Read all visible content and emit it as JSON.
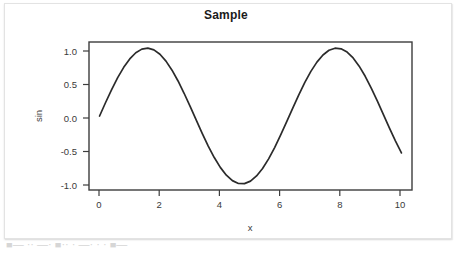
{
  "chart_data": {
    "type": "line",
    "title": "Sample",
    "xlabel": "x",
    "ylabel": "sin",
    "xlim": [
      -0.35,
      10.35
    ],
    "ylim": [
      -1.09,
      1.09
    ],
    "xticks": [
      "0",
      "2",
      "4",
      "6",
      "8",
      "10"
    ],
    "xtick_values": [
      0,
      2,
      4,
      6,
      8,
      10
    ],
    "yticks": [
      "1.0",
      "0.5",
      "0.0",
      "-0.5",
      "-1.0"
    ],
    "ytick_values": [
      1.0,
      0.5,
      0.0,
      -0.5,
      -1.0
    ],
    "grid": false,
    "legend": false,
    "series": [
      {
        "name": "sin(x)",
        "color": "#2b2b2b",
        "x": [
          0.0,
          0.2,
          0.4,
          0.6,
          0.8,
          1.0,
          1.2,
          1.4,
          1.6,
          1.8,
          2.0,
          2.2,
          2.4,
          2.6,
          2.8,
          3.0,
          3.2,
          3.4,
          3.6,
          3.8,
          4.0,
          4.2,
          4.4,
          4.6,
          4.8,
          5.0,
          5.2,
          5.4,
          5.6,
          5.8,
          6.0,
          6.2,
          6.4,
          6.6,
          6.8,
          7.0,
          7.2,
          7.4,
          7.6,
          7.8,
          8.0,
          8.2,
          8.4,
          8.6,
          8.8,
          9.0,
          9.2,
          9.4,
          9.6,
          9.8,
          10.0
        ],
        "y": [
          0.0,
          0.199,
          0.389,
          0.565,
          0.717,
          0.841,
          0.932,
          0.985,
          1.0,
          0.974,
          0.909,
          0.808,
          0.675,
          0.516,
          0.335,
          0.141,
          -0.058,
          -0.256,
          -0.443,
          -0.612,
          -0.757,
          -0.872,
          -0.952,
          -0.994,
          -0.996,
          -0.959,
          -0.883,
          -0.773,
          -0.631,
          -0.465,
          -0.279,
          -0.083,
          0.116,
          0.312,
          0.495,
          0.657,
          0.794,
          0.899,
          0.968,
          0.999,
          0.989,
          0.941,
          0.855,
          0.734,
          0.585,
          0.412,
          0.223,
          0.024,
          -0.175,
          -0.366,
          -0.544
        ]
      }
    ]
  },
  "footer": {
    "clipped_text": "■— ·· —· ■·· · —· · · ■—"
  }
}
